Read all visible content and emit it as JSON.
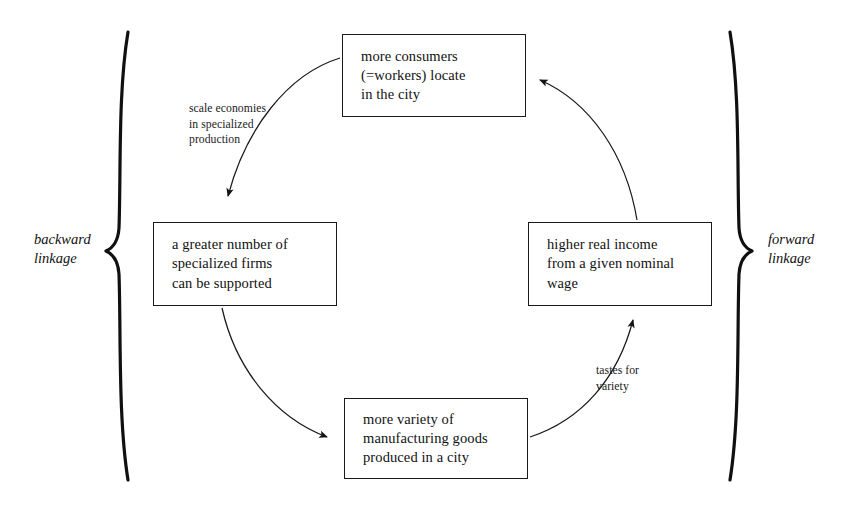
{
  "diagram": {
    "type": "circular-causation-cycle",
    "background_color": "#ffffff",
    "ink_color": "#111111",
    "nodes": [
      {
        "id": "more-consumers",
        "position": "top",
        "text": "more consumers\n(=workers) locate\nin the city"
      },
      {
        "id": "specialized-firms",
        "position": "left",
        "text": "a greater number of\nspecialized firms\ncan be supported"
      },
      {
        "id": "higher-real-income",
        "position": "right",
        "text": "higher real income\nfrom a given nominal\nwage"
      },
      {
        "id": "more-variety",
        "position": "bottom",
        "text": "more variety of\nmanufacturing goods\nproduced in a city"
      }
    ],
    "arrows": [
      {
        "id": "top-to-left",
        "from": "more-consumers",
        "to": "specialized-firms",
        "label": "scale economies\nin specialized\nproduction"
      },
      {
        "id": "left-to-bottom",
        "from": "specialized-firms",
        "to": "more-variety",
        "label": ""
      },
      {
        "id": "bottom-to-right",
        "from": "more-variety",
        "to": "higher-real-income",
        "label": "tastes for\nvariety"
      },
      {
        "id": "right-to-top",
        "from": "higher-real-income",
        "to": "more-consumers",
        "label": ""
      }
    ],
    "braces": [
      {
        "id": "backward-linkage",
        "side": "left",
        "glyph": "left-curly-brace",
        "label": "backward\nlinkage"
      },
      {
        "id": "forward-linkage",
        "side": "right",
        "glyph": "right-curly-brace",
        "label": "forward\nlinkage"
      }
    ]
  }
}
